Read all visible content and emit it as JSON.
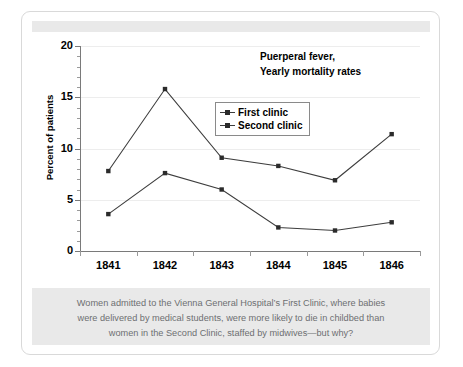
{
  "chart_data": {
    "type": "line",
    "title": "Puerperal fever, Yearly mortality rates",
    "title_line1": "Puerperal fever,",
    "title_line2": "Yearly mortality rates",
    "xlabel": "",
    "ylabel": "Percent of patients",
    "categories": [
      "1841",
      "1842",
      "1843",
      "1844",
      "1845",
      "1846"
    ],
    "series": [
      {
        "name": "First clinic",
        "values": [
          7.8,
          15.8,
          9.1,
          8.3,
          6.9,
          11.4
        ]
      },
      {
        "name": "Second clinic",
        "values": [
          3.6,
          7.6,
          6.0,
          2.3,
          2.0,
          2.8
        ]
      }
    ],
    "ylim": [
      0,
      20
    ],
    "yticks": [
      0,
      5,
      10,
      15,
      20
    ],
    "ytick_labels": [
      "0",
      "5",
      "10",
      "15",
      "20"
    ],
    "grid": true,
    "legend_position": "upper-center",
    "line_color": "#3d3d3d",
    "marker_color": "#2b2b2b",
    "grid_color": "#ededed",
    "axis_color": "#7a7a7a"
  },
  "caption": {
    "line1": "Women admitted to the Vienna General Hospital’s First Clinic, where babies",
    "line2": "were delivered by medical students, were more likely to die in childbed than",
    "line3": "women in the Second Clinic, staffed by midwives—but why?",
    "text_color": "#6d6f71",
    "background": "#e9e9e9"
  },
  "card": {
    "background": "#ffffff",
    "border_color": "#d9d9d9",
    "top_band_color": "#e9e9e9"
  }
}
